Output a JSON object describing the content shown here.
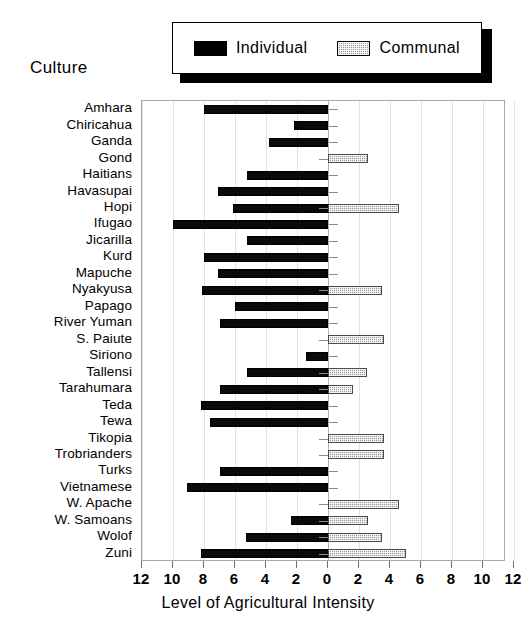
{
  "legend": {
    "entries": [
      {
        "label": "Individual",
        "icon": "filled-black-swatch",
        "color": "#000000"
      },
      {
        "label": "Communal",
        "icon": "hatched-gray-swatch",
        "color": "#9a9a9a"
      }
    ]
  },
  "axes": {
    "y_axis_title": "Culture",
    "x_axis_title": "Level of Agricultural Intensity",
    "x_tick_labels": [
      "12",
      "10",
      "8",
      "6",
      "4",
      "2",
      "0",
      "2",
      "4",
      "6",
      "8",
      "10",
      "12"
    ]
  },
  "chart_data": {
    "type": "bar",
    "title": "",
    "subtitle": "",
    "orientation": "horizontal",
    "style": "diverging-bidirectional",
    "xlabel": "Level of Agricultural Intensity",
    "ylabel": "Culture",
    "xlim": [
      -12,
      12
    ],
    "xticks": [
      -12,
      -10,
      -8,
      -6,
      -4,
      -2,
      0,
      2,
      4,
      6,
      8,
      10,
      12
    ],
    "xtick_labels": [
      "12",
      "10",
      "8",
      "6",
      "4",
      "2",
      "0",
      "2",
      "4",
      "6",
      "8",
      "10",
      "12"
    ],
    "grid": true,
    "legend_position": "top",
    "note": "Individual values extend left from zero; Communal values extend right from zero.",
    "categories": [
      "Amhara",
      "Chiricahua",
      "Ganda",
      "Gond",
      "Haitians",
      "Havasupai",
      "Hopi",
      "Ifugao",
      "Jicarilla",
      "Kurd",
      "Mapuche",
      "Nyakyusa",
      "Papago",
      "River Yuman",
      "S. Paiute",
      "Siriono",
      "Tallensi",
      "Tarahumara",
      "Teda",
      "Tewa",
      "Tikopia",
      "Trobrianders",
      "Turks",
      "Vietnamese",
      "W. Apache",
      "W. Samoans",
      "Wolof",
      "Zuni"
    ],
    "series": [
      {
        "name": "Individual",
        "direction": "left",
        "color": "#000000",
        "values": [
          8,
          2.2,
          3.8,
          0,
          5.2,
          7.1,
          6.1,
          10,
          5.2,
          8,
          7.1,
          8.1,
          6,
          7,
          0,
          1.4,
          5.2,
          7,
          8.2,
          7.6,
          0,
          0,
          7,
          9.1,
          0,
          2.4,
          5.3,
          8.2
        ]
      },
      {
        "name": "Communal",
        "direction": "right",
        "color": "#9a9a9a",
        "values": [
          0,
          0,
          0,
          2.6,
          0,
          0,
          4.6,
          0,
          0,
          0,
          0,
          3.5,
          0,
          0,
          3.6,
          0,
          2.5,
          1.6,
          0,
          0,
          3.6,
          3.6,
          0,
          0,
          4.6,
          2.6,
          3.5,
          5
        ]
      }
    ]
  }
}
